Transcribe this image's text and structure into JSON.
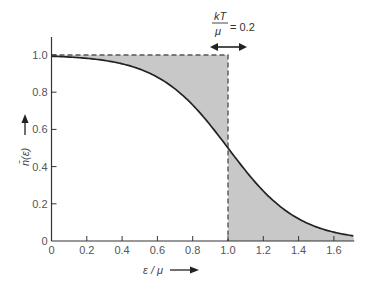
{
  "chart_data": {
    "type": "line",
    "title": "",
    "function": "Fermi-Dirac distribution n(e) = 1/(exp((e/mu - 1)/(kT/mu)) + 1)",
    "xlabel": "ε / μ",
    "ylabel": "n̄(ε)",
    "xlim": [
      0,
      1.715
    ],
    "ylim": [
      0,
      1.1
    ],
    "x_ticks": [
      0,
      0.2,
      0.4,
      0.6,
      0.8,
      1.0,
      1.2,
      1.4,
      1.6
    ],
    "x_tick_labels": [
      "0",
      "0.2",
      "0.4",
      "0.6",
      "0.8",
      "1.0",
      "1.2",
      "1.4",
      "1.6"
    ],
    "y_ticks": [
      0,
      0.2,
      0.4,
      0.6,
      0.8,
      1.0
    ],
    "y_tick_labels": [
      "0",
      "0.2",
      "0.4",
      "0.6",
      "0.8",
      "1.0"
    ],
    "grid": false,
    "legend": null,
    "series": [
      {
        "name": "Fermi-Dirac occupancy (kT/μ = 0.2)",
        "style": "solid",
        "x": [
          0,
          0.1,
          0.2,
          0.3,
          0.4,
          0.5,
          0.6,
          0.7,
          0.8,
          0.9,
          1.0,
          1.1,
          1.2,
          1.3,
          1.4,
          1.5,
          1.6,
          1.7
        ],
        "values": [
          0.993,
          0.989,
          0.982,
          0.971,
          0.953,
          0.924,
          0.881,
          0.818,
          0.731,
          0.622,
          0.5,
          0.378,
          0.269,
          0.182,
          0.119,
          0.076,
          0.047,
          0.029
        ]
      },
      {
        "name": "T = 0 step function",
        "style": "dashed",
        "x": [
          0,
          1.0,
          1.0
        ],
        "values": [
          1.0,
          1.0,
          0
        ]
      }
    ],
    "shaded_regions": [
      {
        "description": "between step function and curve for ε/μ < 1 (above curve, below 1.0)",
        "x_range": [
          0,
          1.0
        ]
      },
      {
        "description": "below curve for ε/μ > 1",
        "x_range": [
          1.0,
          1.715
        ]
      }
    ],
    "annotations": [
      {
        "text_numerator": "kT",
        "text_denominator": "μ",
        "text_value": "= 0.2",
        "x": 1.0,
        "y": 1.04,
        "arrow": "double-headed horizontal, width = 0.2"
      }
    ],
    "kT_over_mu": 0.2,
    "colors": {
      "curve": "#222222",
      "shade": "#c8c8c8",
      "axis": "#333333",
      "dashed": "#555555"
    }
  },
  "labels": {
    "xlabel": "ε / μ",
    "ylabel": "n̄(ε)",
    "annot_num": "kT",
    "annot_den": "μ",
    "annot_val": "= 0.2"
  }
}
